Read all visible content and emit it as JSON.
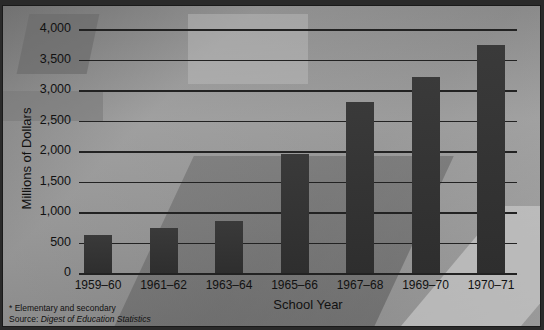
{
  "chart_data": {
    "type": "bar",
    "title": "",
    "xlabel": "School Year",
    "ylabel": "Millions of Dollars",
    "categories": [
      "1959–60",
      "1961–62",
      "1963–64",
      "1965–66",
      "1967–68",
      "1969–70",
      "1970–71"
    ],
    "values": [
      630,
      730,
      860,
      1950,
      2800,
      3220,
      3730
    ],
    "ylim": [
      0,
      4000
    ],
    "yticks": [
      "0",
      "500",
      "1,000",
      "1,500",
      "2,000",
      "2,500",
      "3,000",
      "3,500",
      "4,000"
    ],
    "grid": true,
    "legend": null,
    "bar_color": "#333333"
  },
  "footnote": {
    "note": "* Elementary and secondary",
    "source_label": "Source:",
    "source_title": "Digest of Education Statistics"
  }
}
